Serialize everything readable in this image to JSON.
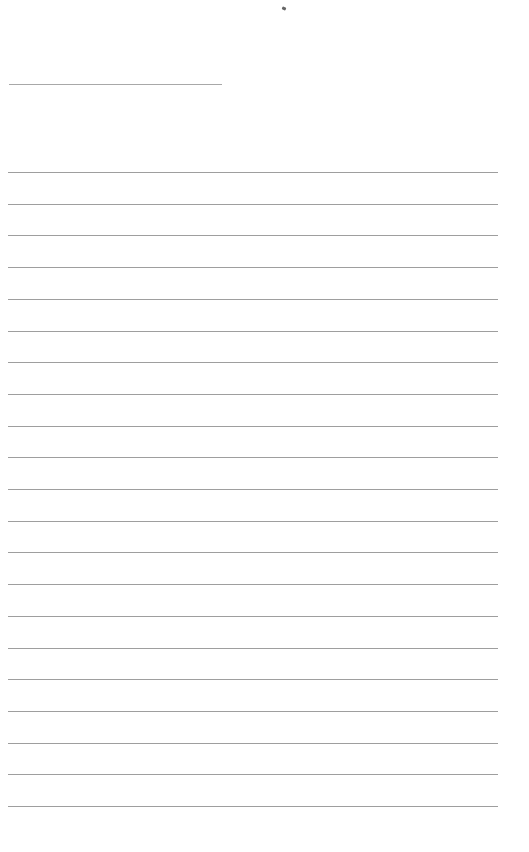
{
  "page": {
    "type": "ruled-sheet",
    "background": "#ffffff",
    "line_color": "#9e9e9e",
    "header_line": {
      "left": 9,
      "top": 84,
      "width": 213
    },
    "rules": {
      "count": 21,
      "first_top": 172,
      "spacing": 31.7,
      "left": 8,
      "width": 490
    },
    "text": []
  }
}
